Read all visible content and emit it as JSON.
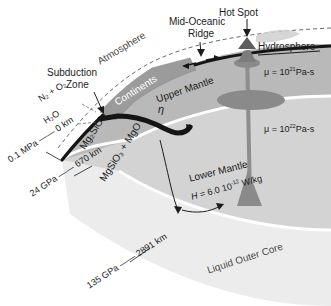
{
  "figure": {
    "background": "#ffffff"
  },
  "colors": {
    "upper_mantle": "#b9b9b9",
    "lower_mantle": "#d2d2d2",
    "outer_core": "#eaeaea",
    "continents": "#9a9a9a",
    "plume": "#8a8a8a",
    "slab": "#111111",
    "text": "#1c1c1c",
    "text_white": "#ffffff",
    "discontinuity": "#ffffff"
  },
  "labels": {
    "atmosphere": "Atmosphere",
    "hydrosphere": "Hydrosphere",
    "continents": "Continents",
    "upper_mantle": "Upper Mantle",
    "lower_mantle": "Lower Mantle",
    "outer_core": "Liquid Outer Core",
    "hot_spot": "Hot Spot",
    "mid_ocean_ridge_line1": "Mid-Oceanic",
    "mid_ocean_ridge_line2": "Ridge",
    "subduction_line1": "Subduction",
    "subduction_line2": "Zone",
    "eta": "η"
  },
  "volatiles": {
    "nitrogen_oxygen": "N₂ + O₂",
    "water": "H₂O"
  },
  "composition": {
    "upper_mantle": "Mg₂SiO₄",
    "lower_mantle": "MgSiO₃ + MgO"
  },
  "boundaries": [
    {
      "id": "surface",
      "pressure": "0.1 MPa",
      "dash": "——",
      "depth": "0 km"
    },
    {
      "id": "d670",
      "pressure": "24 GPa",
      "dash": "——",
      "depth": "670 km"
    },
    {
      "id": "cmb",
      "pressure": "135 GPa",
      "dash": "——",
      "depth": "2891 km"
    }
  ],
  "physical_properties": {
    "viscosity_upper": {
      "symbol": "μ",
      "eq": "=",
      "base": "10",
      "exponent": "21",
      "unit": "Pa-s"
    },
    "viscosity_lower": {
      "symbol": "μ",
      "eq": "=",
      "base": "10",
      "exponent": "22",
      "unit": "Pa-s"
    },
    "heat_production": {
      "symbol": "H",
      "eq": "=",
      "value": "6.0 10",
      "exponent": "-12",
      "unit": "W/kg"
    }
  }
}
